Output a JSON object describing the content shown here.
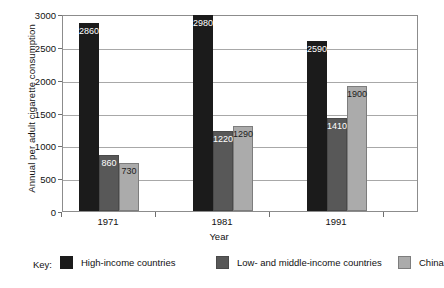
{
  "chart_data": {
    "type": "bar",
    "title": "",
    "xlabel": "Year",
    "ylabel": "Annual per adult cigarette consumption",
    "categories": [
      "1971",
      "1981",
      "1991"
    ],
    "series": [
      {
        "name": "High-income countries",
        "color": "#1b1b1b",
        "values": [
          2860,
          2980,
          2590
        ]
      },
      {
        "name": "Low- and middle-income countries",
        "color": "#585858",
        "values": [
          860,
          1220,
          1410
        ]
      },
      {
        "name": "China",
        "color": "#ababab",
        "values": [
          730,
          1290,
          1900
        ]
      }
    ],
    "ylim": [
      0,
      3000
    ],
    "yticks": [
      0,
      500,
      1000,
      1500,
      2000,
      2500,
      3000
    ],
    "grid": true,
    "legend_position": "bottom",
    "legend_prefix": "Key:"
  }
}
